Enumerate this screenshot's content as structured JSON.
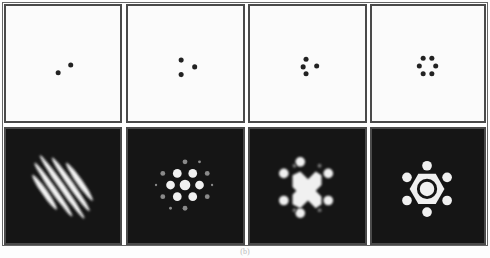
{
  "figure": {
    "panels": [
      {
        "id": "a",
        "apertures": 2,
        "pattern": "stripes"
      },
      {
        "id": "b",
        "apertures": 3,
        "pattern": "hexagonal-spots"
      },
      {
        "id": "c",
        "apertures": 4,
        "pattern": "spots-with-central-cluster"
      },
      {
        "id": "d",
        "apertures": 6,
        "pattern": "ring-with-six-spots"
      }
    ],
    "colors": {
      "dot": "#222222",
      "background_top": "#fbfbfb",
      "background_bottom": "#151515",
      "bright": "#f0f0f0"
    },
    "caption": "(b)"
  }
}
